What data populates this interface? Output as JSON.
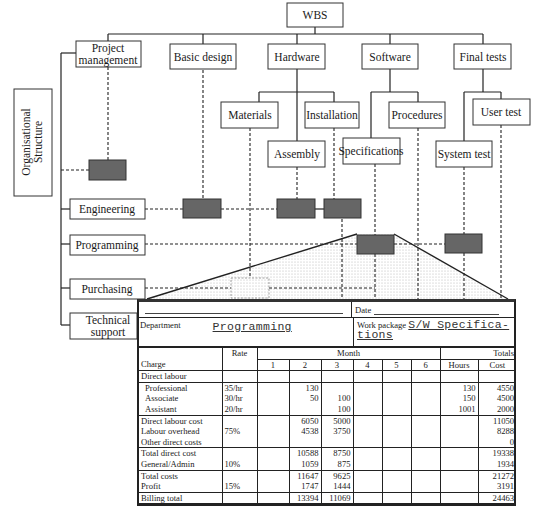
{
  "wbs": {
    "root": "WBS",
    "level1": [
      {
        "label_lines": [
          "Project",
          "management"
        ]
      },
      {
        "label_lines": [
          "Basic design"
        ]
      },
      {
        "label_lines": [
          "Hardware"
        ]
      },
      {
        "label_lines": [
          "Software"
        ]
      },
      {
        "label_lines": [
          "Final tests"
        ]
      }
    ],
    "hardware_children": [
      "Materials",
      "Installation",
      "Assembly"
    ],
    "software_children": [
      "Specifications",
      "Procedures"
    ],
    "final_tests_children": [
      "User test",
      "System test"
    ]
  },
  "org": {
    "title_lines": [
      "Organisational",
      "Structure"
    ],
    "departments": [
      {
        "label_lines": [
          "Engineering"
        ]
      },
      {
        "label_lines": [
          "Programming"
        ]
      },
      {
        "label_lines": [
          "Purchasing"
        ]
      },
      {
        "label_lines": [
          "Technical",
          "support"
        ]
      }
    ]
  },
  "colors": {
    "work_package_fill": "#666666",
    "line": "#222222",
    "stipple": "#cccccc"
  },
  "form": {
    "date_label": "Date",
    "department_label": "Department",
    "department_value": "Programming",
    "work_package_label": "Work package",
    "work_package_value_lines": [
      "S/W Specifica-",
      "tions"
    ],
    "header": {
      "rate": "Rate",
      "month": "Month",
      "totals": "Totals",
      "charge": "Charge",
      "months": [
        "1",
        "2",
        "3",
        "4",
        "5",
        "6"
      ],
      "hours": "Hours",
      "cost": "Cost"
    },
    "rows": [
      {
        "charge": "Direct labour",
        "rate": "",
        "m": [
          "",
          "",
          "",
          "",
          "",
          ""
        ],
        "hours": "",
        "cost": "",
        "indent": false
      },
      {
        "charge": "Professional",
        "rate": "35/hr",
        "m": [
          "",
          "130",
          "",
          "",
          "",
          ""
        ],
        "hours": "130",
        "cost": "4550",
        "indent": true
      },
      {
        "charge": "Associate",
        "rate": "30/hr",
        "m": [
          "",
          "50",
          "100",
          "",
          "",
          ""
        ],
        "hours": "150",
        "cost": "4500",
        "indent": true
      },
      {
        "charge": "Assistant",
        "rate": "20/hr",
        "m": [
          "",
          "",
          "100",
          "",
          "",
          ""
        ],
        "hours": "1001",
        "cost": "2000",
        "indent": true
      },
      {
        "charge": "Direct labour cost",
        "rate": "",
        "m": [
          "",
          "6050",
          "5000",
          "",
          "",
          ""
        ],
        "hours": "",
        "cost": "11050",
        "indent": false
      },
      {
        "charge": "Labour overhead",
        "rate": "75%",
        "m": [
          "",
          "4538",
          "3750",
          "",
          "",
          ""
        ],
        "hours": "",
        "cost": "8288",
        "indent": false
      },
      {
        "charge": "Other direct costs",
        "rate": "",
        "m": [
          "",
          "",
          "",
          "",
          "",
          ""
        ],
        "hours": "",
        "cost": "0",
        "indent": false
      },
      {
        "charge": "Total direct cost",
        "rate": "",
        "m": [
          "",
          "10588",
          "8750",
          "",
          "",
          ""
        ],
        "hours": "",
        "cost": "19338",
        "indent": false
      },
      {
        "charge": "General/Admin",
        "rate": "10%",
        "m": [
          "",
          "1059",
          "875",
          "",
          "",
          ""
        ],
        "hours": "",
        "cost": "1934",
        "indent": false
      },
      {
        "charge": "Total costs",
        "rate": "",
        "m": [
          "",
          "11647",
          "9625",
          "",
          "",
          ""
        ],
        "hours": "",
        "cost": "21272",
        "indent": false
      },
      {
        "charge": "Profit",
        "rate": "15%",
        "m": [
          "",
          "1747",
          "1444",
          "",
          "",
          ""
        ],
        "hours": "",
        "cost": "3191",
        "indent": false
      },
      {
        "charge": "Billing total",
        "rate": "",
        "m": [
          "",
          "13394",
          "11069",
          "",
          "",
          ""
        ],
        "hours": "",
        "cost": "24463",
        "indent": false
      }
    ]
  }
}
